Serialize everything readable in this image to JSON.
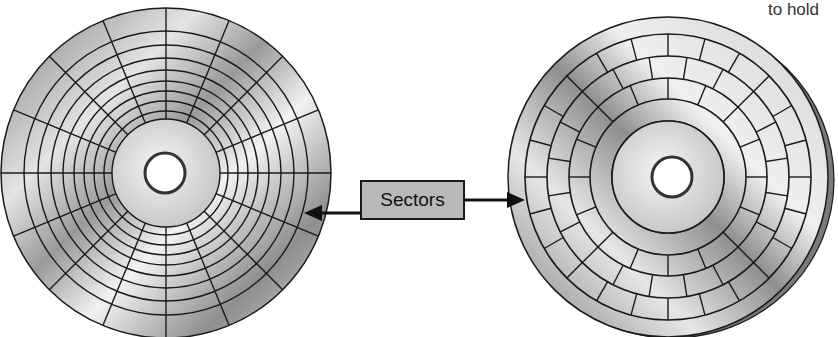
{
  "caption_fragment": "to hold",
  "label": "Sectors",
  "colors": {
    "platter_light": "#e8e8e8",
    "platter_dark": "#8a8a8a",
    "line": "#1a1a1a",
    "label_bg": "#b9b9b9"
  },
  "disks": [
    {
      "name": "zone-less disk",
      "description": "Disk with equal number of sectors per track (radial sector lines)",
      "tracks": 8,
      "sectors_per_track": 16
    },
    {
      "name": "zoned disk",
      "description": "Disk with varying sectors per track (zone bit recording)",
      "tracks": 4
    }
  ]
}
